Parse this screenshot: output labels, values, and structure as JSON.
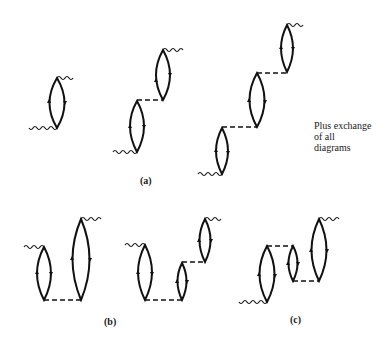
{
  "figure": {
    "background": "#ffffff",
    "line_color": "#111111",
    "note_lines": [
      "Plus exchange",
      "of all",
      "diagrams"
    ],
    "labels": {
      "a": "(a)",
      "b": "(b)",
      "c": "(c)"
    },
    "groups": [
      {
        "id": "a",
        "label": "(a)",
        "diagrams": [
          {
            "name": "a1",
            "bubbles": 1,
            "dashed_lines": 0
          },
          {
            "name": "a2",
            "bubbles": 2,
            "dashed_lines": 1
          },
          {
            "name": "a3",
            "bubbles": 3,
            "dashed_lines": 2
          }
        ]
      },
      {
        "id": "b",
        "label": "(b)",
        "diagrams": [
          {
            "name": "b1",
            "bubbles": 2,
            "dashed_lines": 1
          },
          {
            "name": "b2",
            "bubbles": 3,
            "dashed_lines": 2
          }
        ]
      },
      {
        "id": "c",
        "label": "(c)",
        "diagrams": [
          {
            "name": "c1",
            "bubbles": 3,
            "dashed_lines": 2
          }
        ]
      }
    ]
  }
}
